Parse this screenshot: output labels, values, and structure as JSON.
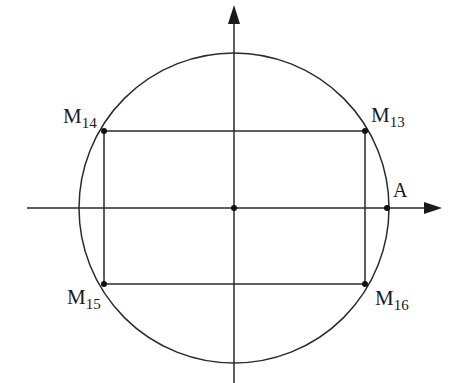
{
  "diagram": {
    "type": "unit-circle",
    "center": {
      "x": 234,
      "y": 208
    },
    "radius": 155,
    "stroke_color": "#2a2a2a",
    "points": [
      {
        "id": "M13",
        "base": "M",
        "sub": "13",
        "x": 365,
        "y": 131
      },
      {
        "id": "M14",
        "base": "M",
        "sub": "14",
        "x": 104,
        "y": 131
      },
      {
        "id": "M15",
        "base": "M",
        "sub": "15",
        "x": 104,
        "y": 284
      },
      {
        "id": "M16",
        "base": "M",
        "sub": "16",
        "x": 365,
        "y": 284
      },
      {
        "id": "A",
        "base": "A",
        "sub": "",
        "x": 387,
        "y": 208
      }
    ],
    "labels": {
      "m13_base": "M",
      "m13_sub": "13",
      "m14_base": "M",
      "m14_sub": "14",
      "m15_base": "M",
      "m15_sub": "15",
      "m16_base": "M",
      "m16_sub": "16",
      "a": "A"
    }
  }
}
